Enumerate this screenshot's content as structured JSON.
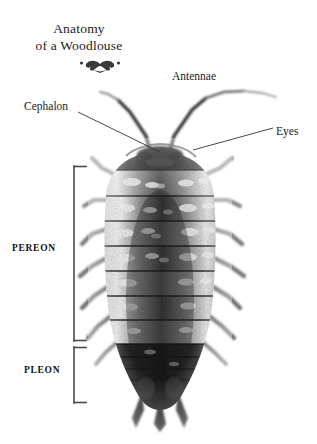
{
  "document": {
    "title_line1": "Anatomy",
    "title_line2": "of a Woodlouse",
    "ornament": "decorative-flourish",
    "background_color": "#ffffff",
    "text_color": "#1b1b1b",
    "leader_line_color": "#333333",
    "bracket_color": "#4a4a4a"
  },
  "labels": {
    "cephalon": "Cephalon",
    "antennae": "Antennae",
    "eyes": "Eyes",
    "pereon": "PEREON",
    "pleon": "PLEON"
  },
  "leader_lines": [
    {
      "name": "cephalon-leader",
      "x1": 78,
      "y1": 112,
      "x2": 160,
      "y2": 152
    },
    {
      "name": "eyes-leader",
      "x1": 273,
      "y1": 128,
      "x2": 193,
      "y2": 150
    }
  ],
  "brackets": [
    {
      "name": "pereon-bracket",
      "top": 166,
      "bottom": 341,
      "x": 74,
      "tick": 12
    },
    {
      "name": "pleon-bracket",
      "top": 347,
      "bottom": 403,
      "x": 74,
      "tick": 12
    }
  ],
  "specimen": {
    "name": "woodlouse-photograph",
    "rendering": "grayscale",
    "body_segments": 7,
    "pleon_segments": 5,
    "legs_per_side": 7,
    "antennae_count": 2,
    "uropods": 3
  }
}
